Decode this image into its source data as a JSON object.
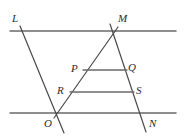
{
  "figure": {
    "type": "geometry-diagram",
    "canvas": {
      "width": 184,
      "height": 139
    },
    "stroke_color": "#555555",
    "label_color": "#2b2b2b",
    "background_color": "#ffffff",
    "labels": [
      {
        "id": "L",
        "text": "L",
        "x": 12,
        "y": 13
      },
      {
        "id": "M",
        "text": "M",
        "x": 118,
        "y": 13
      },
      {
        "id": "P",
        "text": "P",
        "x": 71,
        "y": 63
      },
      {
        "id": "Q",
        "text": "Q",
        "x": 128,
        "y": 62
      },
      {
        "id": "R",
        "text": "R",
        "x": 57,
        "y": 85
      },
      {
        "id": "S",
        "text": "S",
        "x": 136,
        "y": 85
      },
      {
        "id": "O",
        "text": "O",
        "x": 44,
        "y": 118
      },
      {
        "id": "N",
        "text": "N",
        "x": 149,
        "y": 118
      }
    ],
    "lines": [
      {
        "id": "top-parallel-line",
        "x1": 10,
        "y1": 31,
        "x2": 176,
        "y2": 31
      },
      {
        "id": "bottom-parallel-line",
        "x1": 10,
        "y1": 113,
        "x2": 176,
        "y2": 113
      },
      {
        "id": "transversal-L-O",
        "x1": 20,
        "y1": 26,
        "x2": 64,
        "y2": 133
      },
      {
        "id": "transversal-O-M",
        "x1": 54,
        "y1": 118,
        "x2": 118,
        "y2": 27
      },
      {
        "id": "transversal-M-N",
        "x1": 110,
        "y1": 24,
        "x2": 146,
        "y2": 132
      },
      {
        "id": "segment-PQ",
        "x1": 83,
        "y1": 70,
        "x2": 127,
        "y2": 70
      },
      {
        "id": "segment-RS",
        "x1": 70,
        "y1": 92,
        "x2": 134,
        "y2": 92
      }
    ],
    "points": [
      {
        "id": "L",
        "x": 24,
        "y": 31
      },
      {
        "id": "M",
        "x": 114,
        "y": 33
      },
      {
        "id": "P",
        "x": 83,
        "y": 70
      },
      {
        "id": "Q",
        "x": 127,
        "y": 70
      },
      {
        "id": "R",
        "x": 70,
        "y": 92
      },
      {
        "id": "S",
        "x": 134,
        "y": 92
      },
      {
        "id": "O",
        "x": 57,
        "y": 113
      },
      {
        "id": "N",
        "x": 140,
        "y": 113
      }
    ]
  }
}
